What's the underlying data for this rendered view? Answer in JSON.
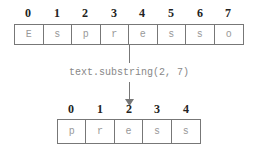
{
  "source": {
    "indices": [
      "0",
      "1",
      "2",
      "3",
      "4",
      "5",
      "6",
      "7"
    ],
    "chars": [
      "E",
      "s",
      "p",
      "r",
      "e",
      "s",
      "s",
      "o"
    ]
  },
  "operation": "text.substring(2, 7)",
  "result": {
    "indices": [
      "0",
      "1",
      "2",
      "3",
      "4"
    ],
    "chars": [
      "p",
      "r",
      "e",
      "s",
      "s"
    ]
  }
}
